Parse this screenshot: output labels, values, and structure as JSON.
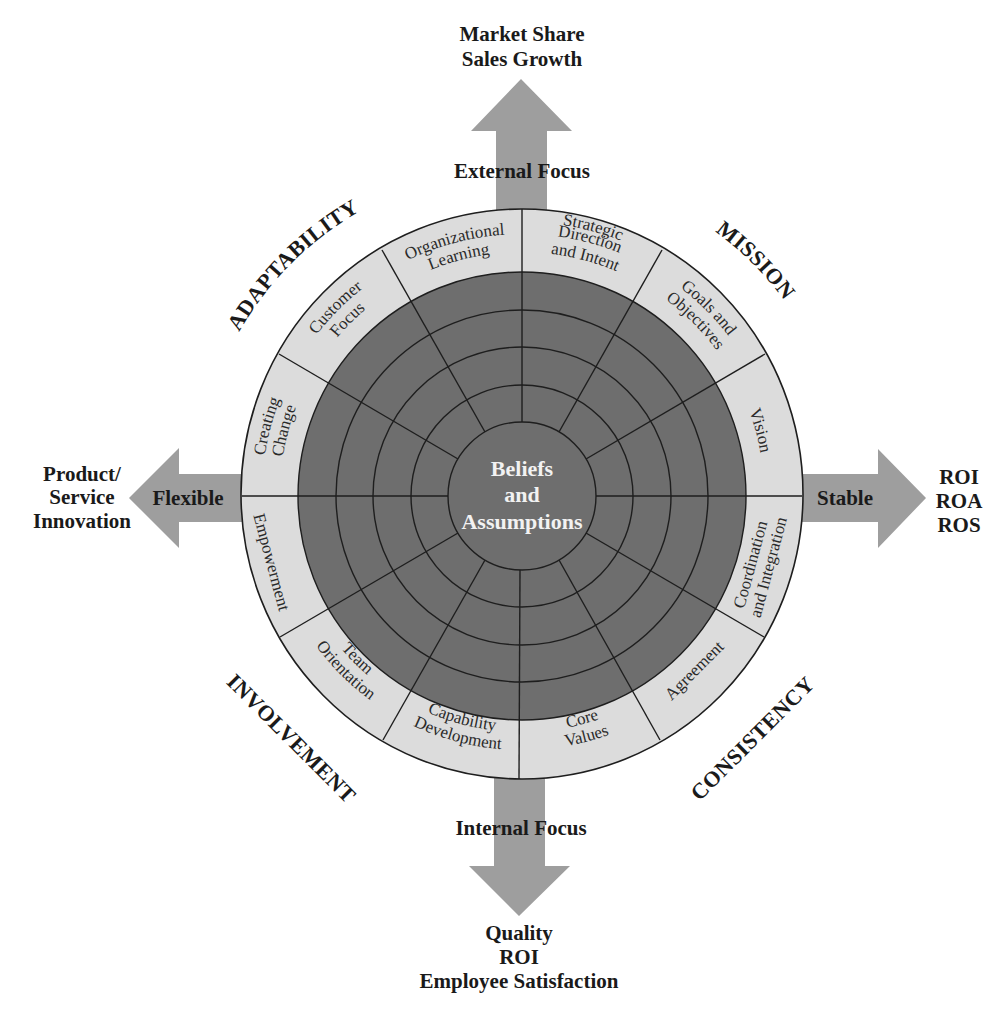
{
  "diagram": {
    "center": {
      "line1": "Beliefs",
      "line2": "and",
      "line3": "Assumptions"
    },
    "axes": {
      "top": {
        "label": "External Focus",
        "outcome": [
          "Market Share",
          "Sales Growth"
        ]
      },
      "bottom": {
        "label": "Internal Focus",
        "outcome": [
          "Quality",
          "ROI",
          "Employee Satisfaction"
        ]
      },
      "left": {
        "label": "Flexible",
        "outcome": [
          "Product/",
          "Service",
          "Innovation"
        ]
      },
      "right": {
        "label": "Stable",
        "outcome": [
          "ROI",
          "ROA",
          "ROS"
        ]
      }
    },
    "quadrants": {
      "top_left": "ADAPTABILITY",
      "top_right": "MISSION",
      "bottom_right": "CONSISTENCY",
      "bottom_left": "INVOLVEMENT"
    },
    "segments": [
      {
        "quadrant": "MISSION",
        "lines": [
          "Strategic",
          "Direction",
          "and Intent"
        ]
      },
      {
        "quadrant": "MISSION",
        "lines": [
          "Goals and",
          "Objectives"
        ]
      },
      {
        "quadrant": "MISSION",
        "lines": [
          "Vision"
        ]
      },
      {
        "quadrant": "CONSISTENCY",
        "lines": [
          "Coordination",
          "and Integration"
        ]
      },
      {
        "quadrant": "CONSISTENCY",
        "lines": [
          "Agreement"
        ]
      },
      {
        "quadrant": "CONSISTENCY",
        "lines": [
          "Core",
          "Values"
        ]
      },
      {
        "quadrant": "INVOLVEMENT",
        "lines": [
          "Capability",
          "Development"
        ]
      },
      {
        "quadrant": "INVOLVEMENT",
        "lines": [
          "Team",
          "Orientation"
        ]
      },
      {
        "quadrant": "INVOLVEMENT",
        "lines": [
          "Empowerment"
        ]
      },
      {
        "quadrant": "ADAPTABILITY",
        "lines": [
          "Creating",
          "Change"
        ]
      },
      {
        "quadrant": "ADAPTABILITY",
        "lines": [
          "Customer",
          "Focus"
        ]
      },
      {
        "quadrant": "ADAPTABILITY",
        "lines": [
          "Organizational",
          "Learning"
        ]
      }
    ],
    "colors": {
      "arrow": "#9e9e9e",
      "outer_band": "#dcdcdc",
      "inner_disk": "#6e6e6e",
      "center_disk": "#6e6e6e",
      "lines": "#1e1e1e",
      "text": "#1a1a1a",
      "center_text": "#f2f2f2"
    }
  }
}
